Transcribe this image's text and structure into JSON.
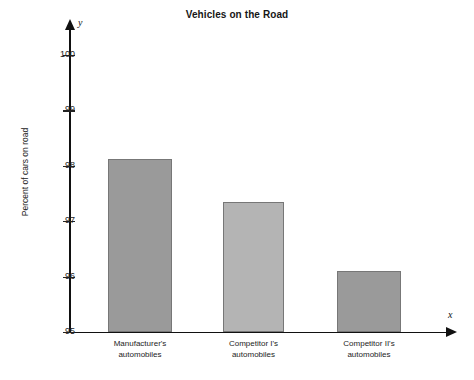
{
  "chart_data": {
    "type": "bar",
    "title": "Vehicles on the Road",
    "xlabel": "x",
    "ylabel": "Percent of cars on road",
    "y_axis_name": "y",
    "x_axis_name": "x",
    "categories": [
      "Manufacturer's automobiles",
      "Competitor I's automobiles",
      "Competitor II's automobiles"
    ],
    "category_lines": [
      [
        "Manufacturer's",
        "automobiles"
      ],
      [
        "Competitor I's",
        "automobiles"
      ],
      [
        "Competitor II's",
        "automobiles"
      ]
    ],
    "values": [
      98.13,
      97.35,
      96.1
    ],
    "ylim": [
      95,
      100
    ],
    "yticks": [
      100,
      99,
      98,
      97,
      96,
      95
    ],
    "ytick_labels": [
      "100",
      "99",
      "98",
      "97",
      "96",
      "95"
    ],
    "grid": false,
    "legend": false,
    "bar_colors": [
      "#9a9a9a",
      "#b4b4b4",
      "#9a9a9a"
    ],
    "bar_border_color": "#777777",
    "axis_color": "#111111"
  }
}
